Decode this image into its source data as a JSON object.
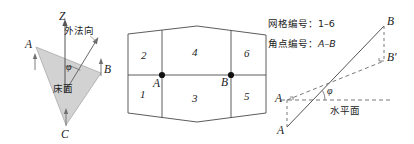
{
  "figure": {
    "panels": {
      "left": {
        "name": "bed-surface-normal-panel",
        "axis_label": "Z",
        "normal_label": "外法向",
        "surface_label": "床面",
        "angle_label": "φ",
        "vertices": [
          "A",
          "B",
          "C"
        ],
        "triangle_fill": "#d4d4d4",
        "triangle_stroke": "#9a9a9a"
      },
      "middle": {
        "name": "grid-cells-panel",
        "cells": [
          "1",
          "2",
          "3",
          "4",
          "5",
          "6"
        ],
        "corner_points": [
          "A",
          "B"
        ],
        "stroke": "#4a4a4a"
      },
      "right": {
        "name": "slope-angle-panel",
        "horizontal_plane_label": "水平面",
        "angle_label": "φ",
        "points": [
          "A",
          "B"
        ],
        "projected_points": [
          "A",
          "B′"
        ],
        "b_prime_label": "B′"
      }
    },
    "legend": {
      "name": "numbering-legend",
      "grid_numbering": "网格编号：1–6",
      "corner_numbering_prefix": "角点编号：",
      "corner_numbering_value": "A–B"
    }
  }
}
